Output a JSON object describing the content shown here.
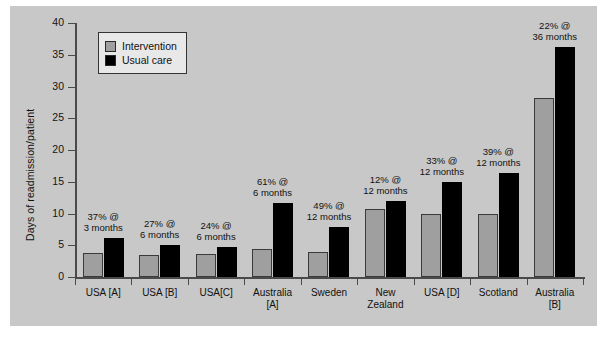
{
  "chart_data": {
    "type": "bar",
    "title": "",
    "xlabel": "",
    "ylabel": "Days of readmission/patient",
    "ylim": [
      0,
      40
    ],
    "yticks": [
      0,
      5,
      10,
      15,
      20,
      25,
      30,
      35,
      40
    ],
    "grid": false,
    "legend_position": "top-left",
    "background_color": "#c8c8c8",
    "categories": [
      "USA [A]",
      "USA [B]",
      "USA[C]",
      "Australia\n[A]",
      "Sweden",
      "New\nZealand",
      "USA [D]",
      "Scotland",
      "Australia\n[B]"
    ],
    "series": [
      {
        "name": "Intervention",
        "color": "#9f9f9f",
        "values": [
          3.8,
          3.4,
          3.6,
          4.4,
          4.0,
          10.7,
          10.0,
          10.0,
          28.2
        ]
      },
      {
        "name": "Usual care",
        "color": "#000000",
        "values": [
          6.2,
          5.1,
          4.8,
          11.7,
          7.8,
          12.0,
          14.9,
          16.4,
          36.2
        ]
      }
    ],
    "annotations": [
      "37% @\n3 months",
      "27% @\n6 months",
      "24% @\n6 months",
      "61% @\n6 months",
      "49% @\n12 months",
      "12% @\n12 months",
      "33% @\n12 months",
      "39% @\n12 months",
      "22% @\n36 months"
    ]
  }
}
